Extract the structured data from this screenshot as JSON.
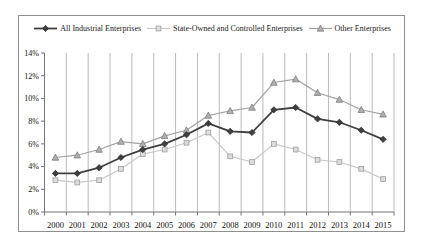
{
  "chart_data": {
    "type": "line",
    "title": "",
    "xlabel": "",
    "ylabel": "",
    "x": [
      2000,
      2001,
      2002,
      2003,
      2004,
      2005,
      2006,
      2007,
      2008,
      2009,
      2010,
      2011,
      2012,
      2013,
      2014,
      2015
    ],
    "series": [
      {
        "name": "All Industrial Enterprises",
        "marker": "diamond",
        "color": "#3f3f3f",
        "marker_fill": "#3f3f3f",
        "marker_stroke": "#2e2e2e",
        "line_width": 1.8,
        "values": [
          3.4,
          3.4,
          3.9,
          4.8,
          5.5,
          6.0,
          6.8,
          7.8,
          7.1,
          7.0,
          9.0,
          9.2,
          8.2,
          7.9,
          7.2,
          6.4
        ]
      },
      {
        "name": "State-Owned and Controlled Enterprises",
        "marker": "square",
        "color": "#c9c9c9",
        "marker_fill": "#dcdcdc",
        "marker_stroke": "#9f9f9f",
        "line_width": 1.2,
        "values": [
          2.8,
          2.6,
          2.8,
          3.8,
          5.1,
          5.5,
          6.1,
          7.0,
          4.9,
          4.4,
          6.0,
          5.5,
          4.6,
          4.4,
          3.8,
          2.9
        ]
      },
      {
        "name": "Other Enterprises",
        "marker": "triangle",
        "color": "#a3a3a3",
        "marker_fill": "#b0b0b0",
        "marker_stroke": "#7d7d7d",
        "line_width": 1.2,
        "values": [
          4.8,
          5.0,
          5.5,
          6.2,
          6.0,
          6.7,
          7.2,
          8.5,
          8.9,
          9.2,
          11.4,
          11.7,
          10.5,
          9.9,
          9.0,
          8.6
        ]
      }
    ],
    "ylim": [
      0,
      14
    ],
    "ytick_step": 2,
    "ytick_suffix": "%",
    "grid": "vertical-only",
    "legend_position": "top"
  }
}
